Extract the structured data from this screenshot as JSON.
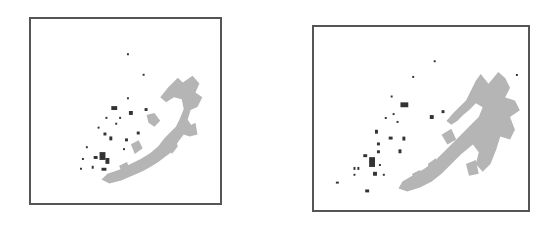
{
  "figure": {
    "panels": [
      {
        "id": "left",
        "description": "clustered point map (gray ring-shaped cluster with dark scattered points)",
        "colors": {
          "frame": "#555555",
          "cluster_gray": "#b0b0b0",
          "points_dark": "#333333"
        }
      },
      {
        "id": "right",
        "description": "clustered point map (gray ring-shaped cluster with dark scattered points)",
        "colors": {
          "frame": "#555555",
          "cluster_gray": "#b0b0b0",
          "points_dark": "#333333"
        }
      }
    ]
  }
}
